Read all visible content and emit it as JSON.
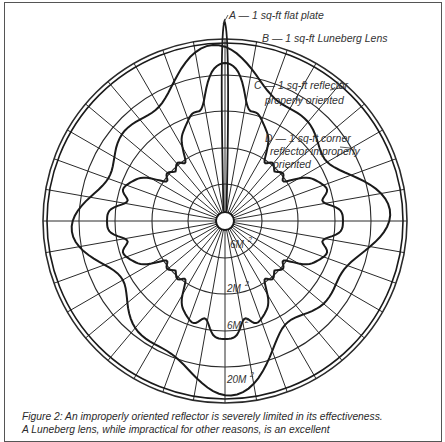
{
  "figure": {
    "center": [
      225,
      221
    ],
    "ring_radii": [
      37,
      73,
      110,
      146,
      182
    ],
    "outer_double_radius": 178,
    "hub_radius": 9,
    "spoke_step_deg": 10,
    "outer_spoke_step_deg": 5,
    "line_color": "#1a1a1a",
    "grid_color": "#2a2a2a"
  },
  "legend": {
    "a": "A — 1 sq-ft flat plate",
    "b": "B — 1 sq-ft Luneberg Lens",
    "c_line1": "C — 1 sq-ft reflector",
    "c_line2": "properly oriented",
    "d_line1": "D — 1 sq-ft corner",
    "d_line2": "reflector improperly",
    "d_line3": "oriented"
  },
  "ring_labels": {
    "r1": "6M",
    "r2": "2M",
    "r3": "6M",
    "r4": "20M",
    "sup": "2"
  },
  "caption": {
    "line1": "Figure 2: An improperly oriented reflector is severely limited in its effectiveness.",
    "line2": "A Luneberg lens, while impractical for other reasons, is an excellent"
  },
  "chart_data": {
    "type": "polar",
    "radial_labels": [
      "6M²",
      "2M²",
      "6M²",
      "20M²"
    ],
    "series": [
      {
        "name": "A — 1 sq-ft flat plate",
        "shape": "narrow spike at 0° reaching beyond outer ring"
      },
      {
        "name": "B — 1 sq-ft Luneberg Lens",
        "shape": "constant circle near outer ring"
      },
      {
        "name": "C — 1 sq-ft reflector properly oriented",
        "shape": "broad wavy lobes, large in all directions"
      },
      {
        "name": "D — 1 sq-ft corner reflector improperly oriented",
        "shape": "small cloverleaf lobes with central spikes"
      }
    ]
  }
}
